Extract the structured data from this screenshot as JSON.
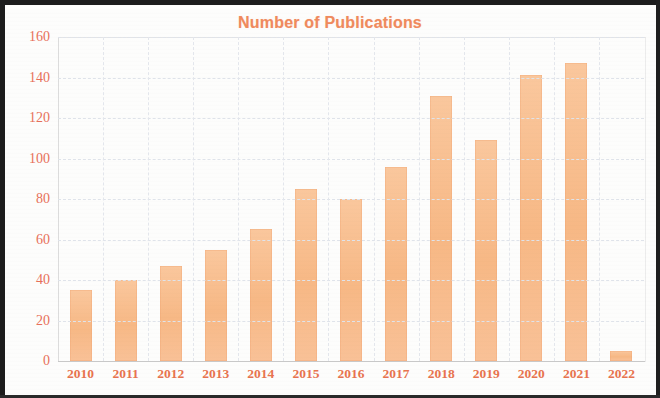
{
  "chart_data": {
    "type": "bar",
    "title": "Number of Publications",
    "xlabel": "",
    "ylabel": "",
    "categories": [
      "2010",
      "2011",
      "2012",
      "2013",
      "2014",
      "2015",
      "2016",
      "2017",
      "2018",
      "2019",
      "2020",
      "2021",
      "2022"
    ],
    "values": [
      35,
      40,
      47,
      55,
      65,
      85,
      80,
      96,
      131,
      109,
      141,
      147,
      5
    ],
    "series": [
      {
        "name": "Number of Publications",
        "values": [
          35,
          40,
          47,
          55,
          65,
          85,
          80,
          96,
          131,
          109,
          141,
          147,
          5
        ]
      }
    ],
    "ylim": [
      0,
      160
    ],
    "ytick_labels": [
      "0",
      "20",
      "40",
      "60",
      "80",
      "100",
      "120",
      "140",
      "160"
    ],
    "ytick_values": [
      0,
      20,
      40,
      60,
      80,
      100,
      120,
      140,
      160
    ],
    "grid": true,
    "legend": false,
    "legend_position": "none",
    "bar_color": "#f8bc8e",
    "title_color": "#f08a5d",
    "tick_label_color": "#e8744f",
    "gridline_color": "#dfe3ea",
    "background_color": "#fdfdfc",
    "frame_color": "#1c1c1c"
  }
}
